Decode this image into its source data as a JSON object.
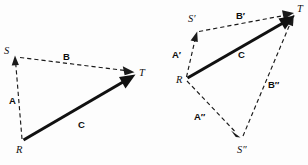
{
  "figure": {
    "background_color": "#fdfdfd",
    "ink_color": "#111111"
  },
  "diagrams": [
    {
      "id": "left-diagram",
      "name": "triangle-law-single",
      "points": [
        {
          "name": "R",
          "label": "R",
          "x": 22,
          "y": 141
        },
        {
          "name": "S",
          "label": "S",
          "x": 15,
          "y": 56
        },
        {
          "name": "T",
          "label": "T",
          "x": 134,
          "y": 72
        }
      ],
      "vectors": [
        {
          "name": "A",
          "label": "A",
          "from": "R",
          "to": "S",
          "style": "dashed",
          "label_x": 13,
          "label_y": 101
        },
        {
          "name": "B",
          "label": "B",
          "from": "S",
          "to": "T",
          "style": "dashed",
          "label_x": 66,
          "label_y": 58
        },
        {
          "name": "C",
          "label": "C",
          "from": "R",
          "to": "T",
          "style": "solid",
          "label_x": 81,
          "label_y": 125
        }
      ]
    },
    {
      "id": "right-diagram",
      "name": "triangle-law-two-paths",
      "points": [
        {
          "name": "R",
          "label": "R",
          "x": 186,
          "y": 79
        },
        {
          "name": "Sprime",
          "label": "S′",
          "x": 197,
          "y": 32
        },
        {
          "name": "Sdoubleprime",
          "label": "S″",
          "x": 242,
          "y": 142
        },
        {
          "name": "T",
          "label": "T",
          "x": 294,
          "y": 13
        }
      ],
      "vectors": [
        {
          "name": "A-prime",
          "label": "A′",
          "from": "R",
          "to": "Sprime",
          "style": "dashed",
          "label_x": 177,
          "label_y": 55
        },
        {
          "name": "B-prime",
          "label": "B′",
          "from": "Sprime",
          "to": "T",
          "style": "dashed",
          "label_x": 240,
          "label_y": 16
        },
        {
          "name": "A-double-prime",
          "label": "A″",
          "from": "R",
          "to": "Sdoubleprime",
          "style": "dashed",
          "label_x": 198,
          "label_y": 117
        },
        {
          "name": "B-double-prime",
          "label": "B″",
          "from": "Sdoubleprime",
          "to": "T",
          "style": "dashed",
          "label_x": 272,
          "label_y": 85
        },
        {
          "name": "C",
          "label": "C",
          "from": "R",
          "to": "T",
          "style": "solid",
          "label_x": 241,
          "label_y": 55
        }
      ]
    }
  ],
  "labels": {
    "left_point_R": "R",
    "left_point_S": "S",
    "left_point_T": "T",
    "left_vector_A": "A",
    "left_vector_B": "B",
    "left_vector_C": "C",
    "right_point_R": "R",
    "right_point_S_prime": "S′",
    "right_point_S_double_prime": "S″",
    "right_point_T": "T",
    "right_vector_A_prime": "A′",
    "right_vector_B_prime": "B′",
    "right_vector_A_double_prime": "A″",
    "right_vector_B_double_prime": "B″",
    "right_vector_C": "C"
  }
}
